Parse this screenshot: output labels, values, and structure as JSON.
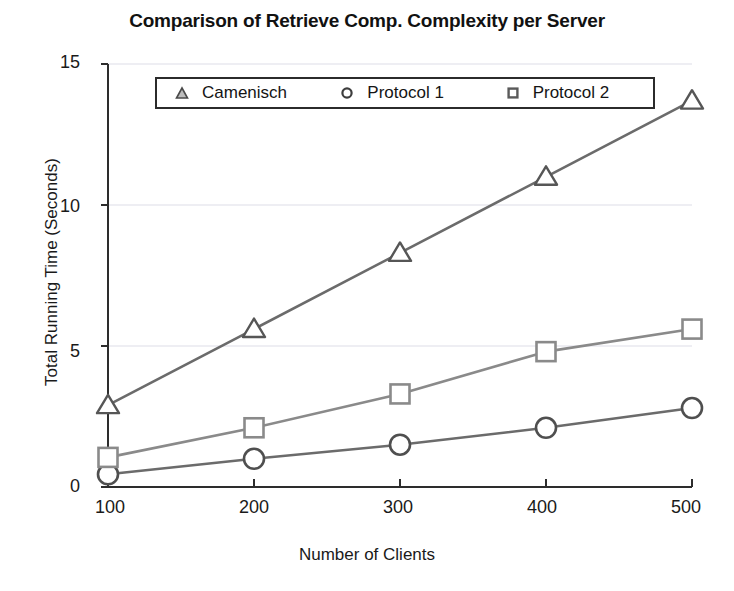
{
  "chart_data": {
    "type": "line",
    "title": "Comparison of Retrieve Comp. Complexity per Server",
    "xlabel": "Number of Clients",
    "ylabel": "Total Running Time (Seconds)",
    "x": [
      100,
      200,
      300,
      400,
      500
    ],
    "xticklabels": [
      "100",
      "200",
      "300",
      "400",
      "500"
    ],
    "yticklabels": [
      "0",
      "5",
      "10",
      "15"
    ],
    "yticks": [
      0,
      5,
      10,
      15
    ],
    "xlim": [
      100,
      500
    ],
    "ylim": [
      0,
      15
    ],
    "grid": true,
    "legend_position": "upper-left-inside",
    "series": [
      {
        "name": "Camenisch",
        "marker": "triangle",
        "color": "#6b6b6b",
        "values": [
          2.9,
          5.6,
          8.3,
          11.0,
          13.7
        ]
      },
      {
        "name": "Protocol 1",
        "marker": "circle",
        "color": "#6b6b6b",
        "values": [
          0.45,
          1.0,
          1.5,
          2.1,
          2.8
        ]
      },
      {
        "name": "Protocol 2",
        "marker": "square",
        "color": "#8a8a8a",
        "values": [
          1.05,
          2.1,
          3.3,
          4.8,
          5.6
        ]
      }
    ]
  },
  "axes": {
    "y_tick_labels": [
      "15",
      "10",
      "5",
      "0"
    ],
    "x_tick_labels": [
      "100",
      "200",
      "300",
      "400",
      "500"
    ]
  },
  "legend": {
    "entries": [
      {
        "label": "Camenisch",
        "marker": "triangle-marker-icon"
      },
      {
        "label": "Protocol 1",
        "marker": "circle-marker-icon"
      },
      {
        "label": "Protocol 2",
        "marker": "square-marker-icon"
      }
    ]
  }
}
